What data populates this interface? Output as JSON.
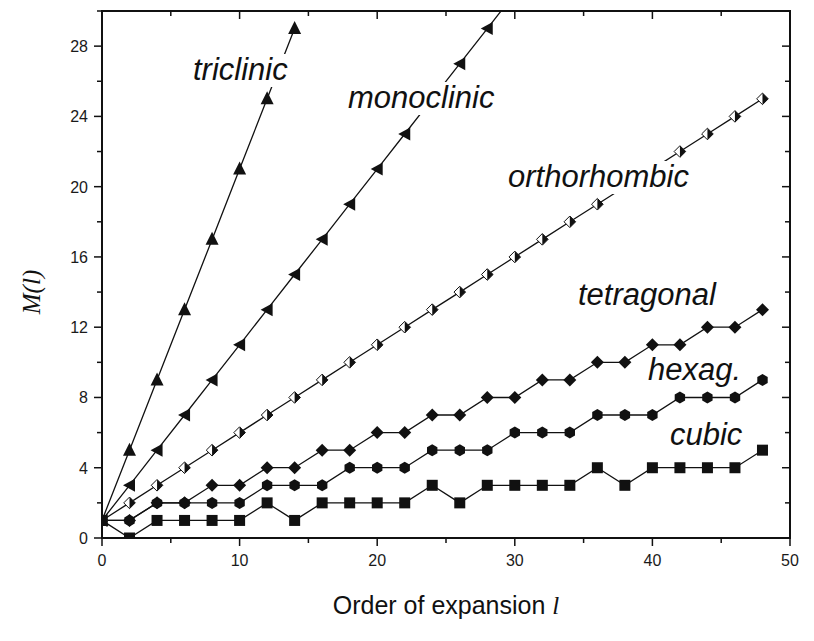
{
  "chart_data": {
    "type": "line",
    "title": "",
    "xlabel": "Order of expansion",
    "xlabel_var": "l",
    "ylabel": "M(l)",
    "xlim": [
      0,
      50
    ],
    "ylim": [
      0,
      30
    ],
    "xticks": [
      0,
      10,
      20,
      30,
      40,
      50
    ],
    "yticks": [
      0,
      4,
      8,
      12,
      16,
      20,
      24,
      28
    ],
    "x_minor_step": 5,
    "y_minor_step": 2,
    "grid": false,
    "legend": "inline labels",
    "series": [
      {
        "name": "triclinic",
        "marker": "triangle-up",
        "x": [
          0,
          2,
          4,
          6,
          8,
          10,
          12,
          14
        ],
        "values": [
          1,
          5,
          9,
          13,
          17,
          21,
          25,
          29
        ],
        "label_pos": [
          193,
          80
        ]
      },
      {
        "name": "monoclinic",
        "marker": "triangle-left",
        "x": [
          0,
          2,
          4,
          6,
          8,
          10,
          12,
          14,
          16,
          18,
          20,
          22,
          24,
          26,
          28,
          30
        ],
        "values": [
          1,
          3,
          5,
          7,
          9,
          11,
          13,
          15,
          17,
          19,
          21,
          23,
          25,
          27,
          29,
          31
        ],
        "label_pos": [
          348,
          108
        ]
      },
      {
        "name": "orthorhombic",
        "marker": "half-diamond",
        "x": [
          0,
          2,
          4,
          6,
          8,
          10,
          12,
          14,
          16,
          18,
          20,
          22,
          24,
          26,
          28,
          30,
          32,
          34,
          36,
          38,
          40,
          42,
          44,
          46,
          48
        ],
        "values": [
          1,
          2,
          3,
          4,
          5,
          6,
          7,
          8,
          9,
          10,
          11,
          12,
          13,
          14,
          15,
          16,
          17,
          18,
          19,
          20,
          21,
          22,
          23,
          24,
          25
        ],
        "label_pos": [
          508,
          187
        ]
      },
      {
        "name": "tetragonal",
        "marker": "diamond",
        "x": [
          0,
          2,
          4,
          6,
          8,
          10,
          12,
          14,
          16,
          18,
          20,
          22,
          24,
          26,
          28,
          30,
          32,
          34,
          36,
          38,
          40,
          42,
          44,
          46,
          48
        ],
        "values": [
          1,
          1,
          2,
          2,
          3,
          3,
          4,
          4,
          5,
          5,
          6,
          6,
          7,
          7,
          8,
          8,
          9,
          9,
          10,
          10,
          11,
          11,
          12,
          12,
          13
        ],
        "label_pos": [
          578,
          305
        ]
      },
      {
        "name": "hexag.",
        "marker": "hexagon",
        "x": [
          0,
          2,
          4,
          6,
          8,
          10,
          12,
          14,
          16,
          18,
          20,
          22,
          24,
          26,
          28,
          30,
          32,
          34,
          36,
          38,
          40,
          42,
          44,
          46,
          48
        ],
        "values": [
          1,
          1,
          2,
          2,
          2,
          2,
          3,
          3,
          3,
          4,
          4,
          4,
          5,
          5,
          5,
          6,
          6,
          6,
          7,
          7,
          7,
          8,
          8,
          8,
          9
        ],
        "label_pos": [
          648,
          380
        ]
      },
      {
        "name": "cubic",
        "marker": "square",
        "x": [
          0,
          2,
          4,
          6,
          8,
          10,
          12,
          14,
          16,
          18,
          20,
          22,
          24,
          26,
          28,
          30,
          32,
          34,
          36,
          38,
          40,
          42,
          44,
          46,
          48
        ],
        "values": [
          1,
          0,
          1,
          1,
          1,
          1,
          2,
          1,
          2,
          2,
          2,
          2,
          3,
          2,
          3,
          3,
          3,
          3,
          4,
          3,
          4,
          4,
          4,
          4,
          5
        ],
        "label_pos": [
          670,
          445
        ]
      }
    ]
  },
  "colors": {
    "background": "#ffffff",
    "ink": "#111111"
  }
}
